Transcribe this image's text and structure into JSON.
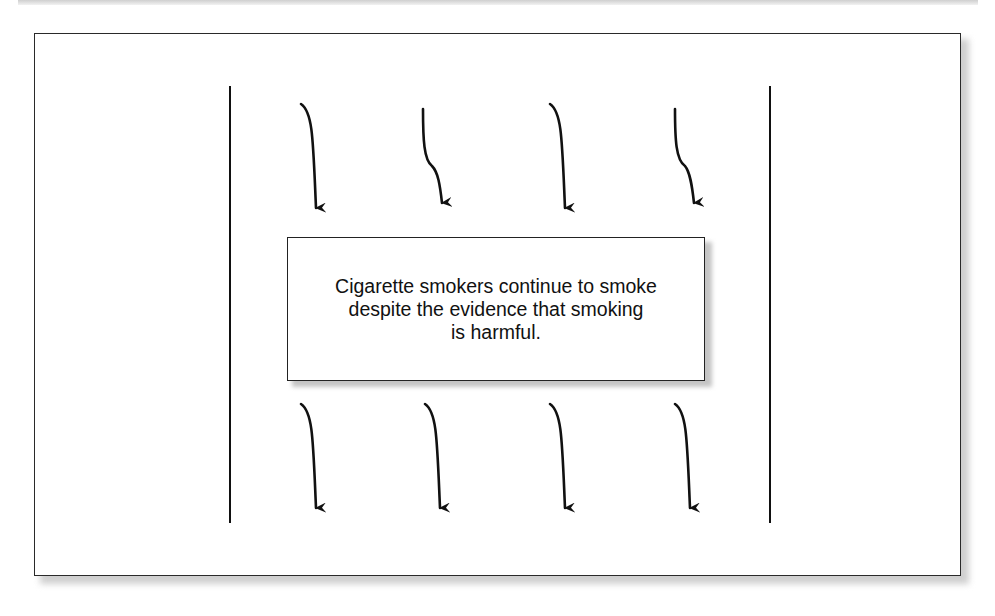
{
  "diagram": {
    "central_statement": {
      "line1": "Cigarette smokers continue to smoke",
      "line2": "despite the evidence that smoking",
      "line3": "is harmful."
    },
    "arrows_above": {
      "count": 4,
      "direction": "down",
      "icon": "arrow-down-icon"
    },
    "arrows_below": {
      "count": 4,
      "direction": "down",
      "icon": "arrow-down-icon"
    },
    "boundaries": {
      "count": 2,
      "orientation": "vertical"
    },
    "colors": {
      "stroke": "#111111",
      "background": "#ffffff",
      "shadow": "#c4c4c4"
    }
  }
}
